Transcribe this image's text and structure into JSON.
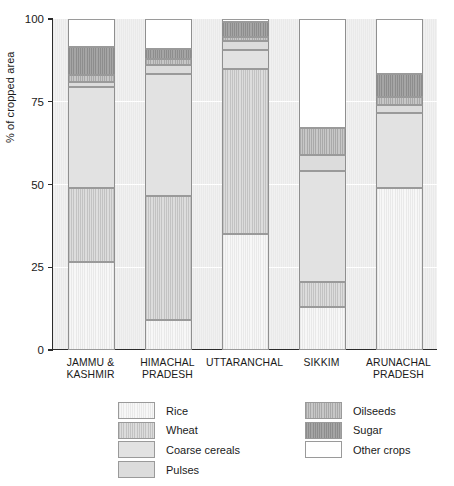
{
  "chart_data": {
    "type": "bar",
    "stacked": true,
    "title": "",
    "xlabel": "",
    "ylabel": "% of cropped area",
    "ylim": [
      0,
      100
    ],
    "yticks": [
      0,
      25,
      50,
      75,
      100
    ],
    "ytick_labels": [
      "0",
      "25",
      "50",
      "75",
      "100"
    ],
    "grid": "horizontal-white-gridlines",
    "legend_position": "below-plot",
    "categories": [
      "JAMMU & KASHMIR",
      "HIMACHAL PRADESH",
      "UTTARANCHAL",
      "SIKKIM",
      "ARUNACHAL PRADESH"
    ],
    "category_lines": [
      [
        "JAMMU &",
        "KASHMIR"
      ],
      [
        "HIMACHAL",
        "PRADESH"
      ],
      [
        "UTTARANCHAL",
        ""
      ],
      [
        "SIKKIM",
        ""
      ],
      [
        "ARUNACHAL",
        "PRADESH"
      ]
    ],
    "series": [
      {
        "name": "Rice",
        "key": "rice",
        "pattern": "pat-rice",
        "color": "#f4f4f4",
        "values": [
          26.5,
          9.0,
          35.0,
          13.0,
          49.0
        ]
      },
      {
        "name": "Wheat",
        "key": "wheat",
        "pattern": "pat-wheat",
        "color": "#d4d4d4",
        "values": [
          22.5,
          37.5,
          50.0,
          7.5,
          0.0
        ]
      },
      {
        "name": "Coarse cereals",
        "key": "coarse",
        "pattern": "pat-coarse",
        "color": "#e2e2e2",
        "values": [
          30.5,
          37.0,
          5.5,
          33.5,
          22.5
        ]
      },
      {
        "name": "Pulses",
        "key": "pulses",
        "pattern": "pat-pulses",
        "color": "#dcdcdc",
        "values": [
          1.5,
          2.5,
          3.0,
          5.0,
          2.5
        ]
      },
      {
        "name": "Oilseeds",
        "key": "oilseeds",
        "pattern": "pat-oilseeds",
        "color": "#bdbdbd",
        "values": [
          2.0,
          2.0,
          1.0,
          8.0,
          2.5
        ]
      },
      {
        "name": "Sugar",
        "key": "sugar",
        "pattern": "pat-sugar",
        "color": "#9c9c9c",
        "values": [
          8.5,
          3.0,
          4.5,
          0.0,
          7.0
        ]
      },
      {
        "name": "Other crops",
        "key": "other",
        "pattern": "pat-other",
        "color": "#ffffff",
        "values": [
          8.5,
          9.0,
          1.0,
          33.0,
          16.5
        ]
      }
    ]
  },
  "legend": {
    "left_column": [
      "Rice",
      "Wheat",
      "Coarse cereals",
      "Pulses"
    ],
    "right_column": [
      "Oilseeds",
      "Sugar",
      "Other crops"
    ]
  }
}
